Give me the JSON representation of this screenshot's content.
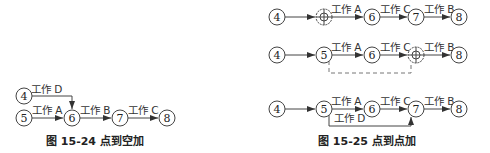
{
  "figure_24": {
    "caption": "图 15-24   点到空加",
    "nodes": {
      "n4": "4",
      "n5": "5",
      "n6": "6",
      "n7": "7",
      "n8": "8"
    },
    "labels": {
      "d": "工作 D",
      "a": "工作 A",
      "b": "工作 B",
      "c": "工作 C"
    }
  },
  "figure_25": {
    "caption": "图 15-25   点到点加",
    "row1": {
      "nodes": {
        "n4": "4",
        "n6": "6",
        "n7": "7",
        "n8": "8"
      },
      "labels": {
        "a": "工作 A",
        "c": "工作 C",
        "b": "工作 B"
      }
    },
    "row2": {
      "nodes": {
        "n4": "4",
        "n5": "5",
        "n6": "6",
        "n8": "8"
      },
      "labels": {
        "a": "工作 A",
        "c": "工作 C",
        "b": "工作 B"
      }
    },
    "row3": {
      "nodes": {
        "n4": "4",
        "n5": "5",
        "n6": "6",
        "n7": "7",
        "n8": "8"
      },
      "labels": {
        "a": "工作 A",
        "c": "工作 C",
        "b": "工作 B",
        "d": "工作 D"
      }
    }
  }
}
